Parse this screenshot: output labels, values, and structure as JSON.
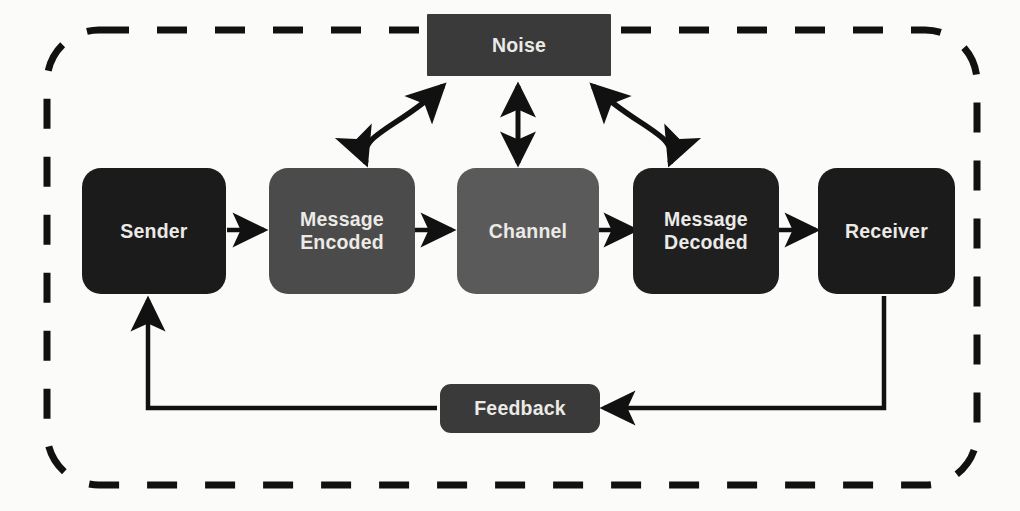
{
  "diagram": {
    "title_text": "",
    "background_color": "#fbfbf9",
    "border": {
      "style": "dashed",
      "color": "#111111",
      "label": "system-boundary"
    },
    "label_color": "#ebeae6",
    "nodes": {
      "noise": {
        "label": "Noise",
        "color": "#3a3a3a",
        "shape": "rectangle"
      },
      "sender": {
        "label": "Sender",
        "color": "#1b1b1b",
        "shape": "rounded-rectangle"
      },
      "message_encoded": {
        "label": "Message\nEncoded",
        "color": "#4b4b4b",
        "shape": "rounded-rectangle"
      },
      "channel": {
        "label": "Channel",
        "color": "#5a5a5a",
        "shape": "rounded-rectangle"
      },
      "message_decoded": {
        "label": "Message\nDecoded",
        "color": "#1f1f1f",
        "shape": "rounded-rectangle"
      },
      "receiver": {
        "label": "Receiver",
        "color": "#1b1b1b",
        "shape": "rounded-rectangle"
      },
      "feedback": {
        "label": "Feedback",
        "color": "#3a3a3a",
        "shape": "rounded-rectangle"
      }
    },
    "connectors": [
      {
        "name": "sender-to-message-encoded",
        "from": "sender",
        "to": "message_encoded",
        "kind": "straight",
        "heads": "single"
      },
      {
        "name": "message-encoded-to-channel",
        "from": "message_encoded",
        "to": "channel",
        "kind": "straight",
        "heads": "single"
      },
      {
        "name": "channel-to-message-decoded",
        "from": "channel",
        "to": "message_decoded",
        "kind": "straight",
        "heads": "single"
      },
      {
        "name": "message-decoded-to-receiver",
        "from": "message_decoded",
        "to": "receiver",
        "kind": "straight",
        "heads": "single"
      },
      {
        "name": "noise-message-encoded",
        "from": "noise",
        "to": "message_encoded",
        "kind": "curved",
        "heads": "double"
      },
      {
        "name": "noise-channel",
        "from": "noise",
        "to": "channel",
        "kind": "straight",
        "heads": "double"
      },
      {
        "name": "noise-message-decoded",
        "from": "noise",
        "to": "message_decoded",
        "kind": "curved",
        "heads": "double"
      },
      {
        "name": "receiver-to-feedback",
        "from": "receiver",
        "to": "feedback",
        "kind": "elbow",
        "heads": "single"
      },
      {
        "name": "feedback-to-sender",
        "from": "feedback",
        "to": "sender",
        "kind": "elbow",
        "heads": "single"
      }
    ]
  }
}
